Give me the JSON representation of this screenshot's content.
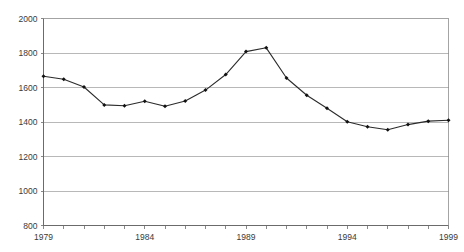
{
  "chart_data": {
    "type": "line",
    "title": "",
    "subtitle": "",
    "xlabel": "",
    "ylabel": "",
    "grid": "horizontal",
    "legend": "none",
    "xlim": [
      1979,
      1999
    ],
    "ylim": [
      800,
      2000
    ],
    "y_ticks": [
      800,
      1000,
      1200,
      1400,
      1600,
      1800,
      2000
    ],
    "x_ticks": [
      1979,
      1980,
      1981,
      1982,
      1983,
      1984,
      1985,
      1986,
      1987,
      1988,
      1989,
      1990,
      1991,
      1992,
      1993,
      1994,
      1995,
      1996,
      1997,
      1998,
      1999
    ],
    "x_tick_labels": [
      "1979",
      "",
      "",
      "",
      "",
      "1984",
      "",
      "",
      "",
      "",
      "1989",
      "",
      "",
      "",
      "",
      "1994",
      "",
      "",
      "",
      "",
      "1999"
    ],
    "x_labeled_ticks": [
      "1979",
      "1984",
      "1989",
      "1994",
      "1999"
    ],
    "series": [
      {
        "name": "series-1",
        "color": "#1f1f1f",
        "marker": "diamond",
        "x": [
          1979,
          1980,
          1981,
          1982,
          1983,
          1984,
          1985,
          1986,
          1987,
          1988,
          1989,
          1990,
          1991,
          1992,
          1993,
          1994,
          1995,
          1996,
          1997,
          1998,
          1999
        ],
        "values": [
          1665,
          1648,
          1603,
          1499,
          1494,
          1520,
          1491,
          1522,
          1585,
          1675,
          1808,
          1830,
          1655,
          1555,
          1480,
          1401,
          1372,
          1355,
          1385,
          1405,
          1410
        ]
      }
    ]
  },
  "axis": {
    "y_labels": [
      "2000",
      "1800",
      "1600",
      "1400",
      "1200",
      "1000",
      "800"
    ],
    "x_labels": [
      "1979",
      "1984",
      "1989",
      "1994",
      "1999"
    ]
  },
  "colors": {
    "gridline": "#9a9a9a",
    "axis": "#6b6b6b",
    "series": "#1f1f1f",
    "text": "#3a3a3a",
    "background": "#ffffff"
  }
}
